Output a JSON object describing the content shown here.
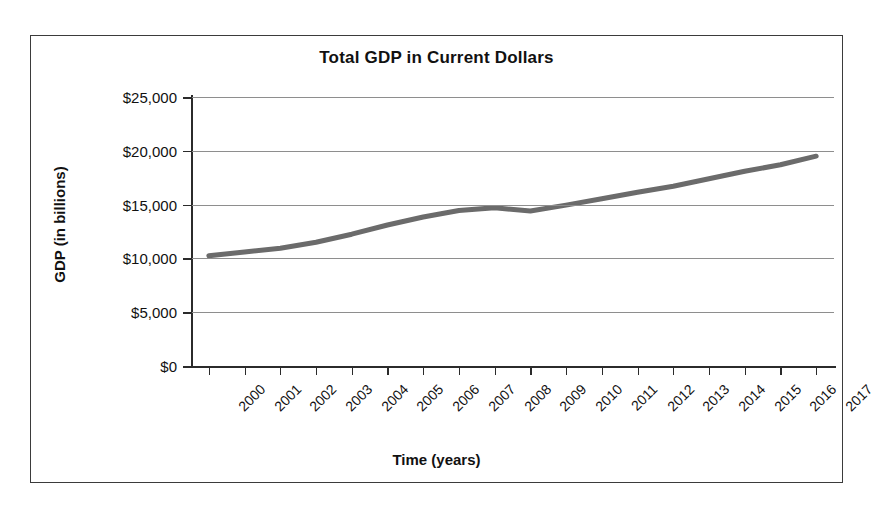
{
  "chart_data": {
    "type": "line",
    "title": "Total GDP in Current Dollars",
    "xlabel": "Time (years)",
    "ylabel": "GDP (in billions)",
    "x": [
      2000,
      2001,
      2002,
      2003,
      2004,
      2005,
      2006,
      2007,
      2008,
      2009,
      2010,
      2011,
      2012,
      2013,
      2014,
      2015,
      2016,
      2017
    ],
    "categories": [
      "2000",
      "2001",
      "2002",
      "2003",
      "2004",
      "2005",
      "2006",
      "2007",
      "2008",
      "2009",
      "2010",
      "2011",
      "2012",
      "2013",
      "2014",
      "2015",
      "2016",
      "2017"
    ],
    "values": [
      10250,
      10600,
      10950,
      11500,
      12250,
      13100,
      13850,
      14450,
      14700,
      14400,
      14950,
      15550,
      16150,
      16700,
      17400,
      18100,
      18700,
      19500
    ],
    "series": [
      {
        "name": "Total GDP",
        "color": "#6b6b6b",
        "values": [
          10250,
          10600,
          10950,
          11500,
          12250,
          13100,
          13850,
          14450,
          14700,
          14400,
          14950,
          15550,
          16150,
          16700,
          17400,
          18100,
          18700,
          19500
        ]
      }
    ],
    "ylim": [
      0,
      25000
    ],
    "ytick_values": [
      0,
      5000,
      10000,
      15000,
      20000,
      25000
    ],
    "ytick_labels": [
      "$0",
      "$5,000",
      "$10,000",
      "$15,000",
      "$20,000",
      "$25,000"
    ],
    "grid": true,
    "gridline_color": "#8e8e8e",
    "legend": false,
    "legend_position": "none",
    "axis_color": "#2b2b2b",
    "background_color": "#ffffff",
    "border_color": "#3b3b3b",
    "xtick_rotation": -45
  }
}
